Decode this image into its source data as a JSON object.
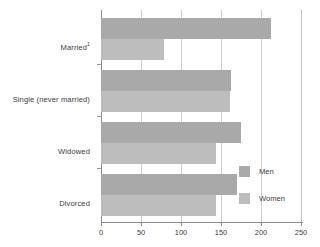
{
  "chart_data": {
    "type": "bar",
    "orientation": "horizontal",
    "title": "",
    "subtitle": "",
    "xlabel": "",
    "ylabel": "",
    "xlim": [
      0,
      250
    ],
    "xticks": [
      0,
      50,
      100,
      150,
      200,
      250
    ],
    "xtick_labels": [
      "0",
      "50",
      "100",
      "150",
      "200",
      "250"
    ],
    "grid": "vertical",
    "legend_position": "inside-bottom-right",
    "categories": [
      "Married",
      "Single (never married)",
      "Widowed",
      "Divorced"
    ],
    "category_labels": [
      {
        "text": "Married",
        "superscript": "1"
      },
      {
        "text": "Single (never married)",
        "superscript": ""
      },
      {
        "text": "Widowed",
        "superscript": ""
      },
      {
        "text": "Divorced",
        "superscript": ""
      }
    ],
    "series": [
      {
        "name": "Men",
        "color": "#a9a9a9",
        "values": [
          212,
          163,
          175,
          170
        ]
      },
      {
        "name": "Women",
        "color": "#bdbdbd",
        "values": [
          79,
          161,
          144,
          144
        ]
      }
    ]
  },
  "legend": {
    "items": [
      {
        "label": "Men",
        "color": "#a9a9a9"
      },
      {
        "label": "Women",
        "color": "#bdbdbd"
      }
    ]
  },
  "colors": {
    "men_bar": "#a9a9a9",
    "women_bar": "#bdbdbd",
    "axis": "#8c8c8c",
    "gridline": "#cfcfcf",
    "text": "#3d3d3d",
    "background": "#ffffff"
  }
}
